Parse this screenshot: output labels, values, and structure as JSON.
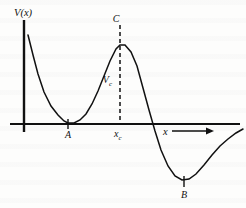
{
  "figure": {
    "kind": "potential-energy-curve",
    "background_color": "#fdfdfc",
    "ink_color": "#111111"
  },
  "axes": {
    "y_axis_label": "V(x)",
    "x_axis_label": "x",
    "x_axis_has_arrow": true,
    "origin_px": [
      24,
      124
    ],
    "x_axis_span_px": [
      10,
      240
    ],
    "y_axis_span_px": [
      20,
      132
    ]
  },
  "labels": {
    "peak_label": "C",
    "peak_value_label": "V",
    "peak_value_subscript": "c",
    "left_min_label": "A",
    "right_min_label": "B",
    "critical_x_label": "x",
    "critical_x_subscript": "c"
  },
  "markers": {
    "A_tick_x": 68,
    "B_tick_x": 184,
    "dashed_x": 120
  },
  "chart_data": {
    "type": "line",
    "title": "",
    "xlabel": "x",
    "ylabel": "V(x)",
    "grid": false,
    "legend": null,
    "series": [
      {
        "name": "V(x)",
        "points_px": [
          [
            28,
            35
          ],
          [
            33,
            55
          ],
          [
            38,
            74
          ],
          [
            44,
            92
          ],
          [
            51,
            106
          ],
          [
            58,
            115
          ],
          [
            64,
            121
          ],
          [
            68,
            123
          ],
          [
            74,
            123
          ],
          [
            80,
            120
          ],
          [
            86,
            114
          ],
          [
            92,
            104
          ],
          [
            98,
            91
          ],
          [
            104,
            76
          ],
          [
            110,
            61
          ],
          [
            116,
            49
          ],
          [
            120,
            45
          ],
          [
            125,
            45
          ],
          [
            131,
            52
          ],
          [
            137,
            66
          ],
          [
            143,
            88
          ],
          [
            149,
            110
          ],
          [
            155,
            131
          ],
          [
            161,
            150
          ],
          [
            168,
            166
          ],
          [
            175,
            176
          ],
          [
            182,
            180
          ],
          [
            189,
            179
          ],
          [
            196,
            174
          ],
          [
            204,
            165
          ],
          [
            212,
            155
          ],
          [
            220,
            146
          ],
          [
            228,
            139
          ],
          [
            236,
            133
          ],
          [
            243,
            129
          ]
        ]
      }
    ],
    "annotations": [
      {
        "label": "A",
        "role": "left-minimum",
        "x_px": 68,
        "y_px": 124,
        "note": "curve touches axis"
      },
      {
        "label": "C",
        "role": "maximum",
        "x_px": 120,
        "y_px": 45
      },
      {
        "label": "B",
        "role": "right-minimum",
        "x_px": 184,
        "y_px": 180
      },
      {
        "label": "Vc",
        "role": "barrier-height",
        "x_px": 120,
        "y_px": 80
      },
      {
        "label": "xc",
        "role": "critical-x",
        "x_px": 120,
        "y_px": 124
      }
    ],
    "axis_crossings_px": [
      68,
      149
    ]
  }
}
